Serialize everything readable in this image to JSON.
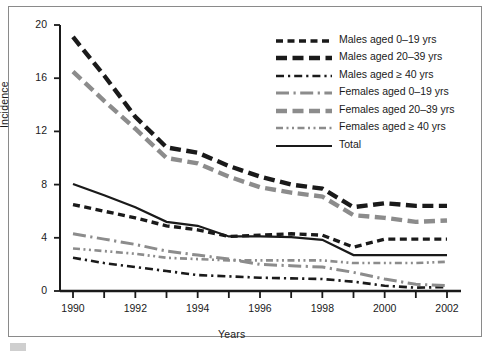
{
  "figure": {
    "y_axis_title": "Incidence",
    "x_axis_title": "Years"
  },
  "chart_data": {
    "type": "line",
    "title": "",
    "xlabel": "Years",
    "ylabel": "Incidence",
    "xlim": [
      1989.5,
      2002.5
    ],
    "ylim": [
      0,
      20
    ],
    "ytick_values": [
      0,
      4,
      8,
      12,
      16,
      20
    ],
    "ytick_labels": [
      "0",
      "4",
      "8",
      "12",
      "16",
      "20"
    ],
    "xtick_values": [
      1990,
      1991,
      1992,
      1993,
      1994,
      1995,
      1996,
      1997,
      1998,
      1999,
      2000,
      2001,
      2002
    ],
    "xtick_labels": [
      "1990",
      "",
      "1992",
      "",
      "1994",
      "",
      "1996",
      "",
      "1998",
      "",
      "2000",
      "",
      "2002"
    ],
    "grid": false,
    "legend_position": "upper right",
    "x": [
      1990,
      1991,
      1992,
      1993,
      1994,
      1995,
      1996,
      1997,
      1998,
      1999,
      2000,
      2001,
      2002
    ],
    "series": [
      {
        "name": "Males aged 0–19 yrs",
        "style": "dashed-short",
        "color": "#1a1a1a",
        "values": [
          6.5,
          6.0,
          5.5,
          4.9,
          4.6,
          4.1,
          4.2,
          4.3,
          4.2,
          3.3,
          3.9,
          3.9,
          3.9
        ]
      },
      {
        "name": "Males aged 20–39 yrs",
        "style": "dashed-long",
        "color": "#1a1a1a",
        "values": [
          19.1,
          16.2,
          13.1,
          10.8,
          10.4,
          9.4,
          8.6,
          8.0,
          7.7,
          6.3,
          6.6,
          6.4,
          6.4
        ]
      },
      {
        "name": "Males aged ≥ 40 yrs",
        "style": "dash-dot",
        "color": "#1a1a1a",
        "values": [
          2.5,
          2.1,
          1.8,
          1.5,
          1.2,
          1.1,
          1.0,
          0.95,
          0.9,
          0.7,
          0.4,
          0.25,
          0.3
        ]
      },
      {
        "name": "Females aged 0–19 yrs",
        "style": "long-dash-dot",
        "color": "#8c8c8c",
        "values": [
          4.3,
          3.9,
          3.5,
          3.0,
          2.7,
          2.4,
          2.0,
          1.9,
          1.8,
          1.4,
          0.9,
          0.5,
          0.4
        ]
      },
      {
        "name": "Females aged 20–39 yrs",
        "style": "dashed-long",
        "color": "#8c8c8c",
        "values": [
          16.5,
          14.3,
          12.2,
          10.0,
          9.6,
          8.6,
          7.8,
          7.4,
          7.1,
          5.7,
          5.5,
          5.2,
          5.3
        ]
      },
      {
        "name": "Females aged ≥ 40 yrs",
        "style": "dash-dot-dot",
        "color": "#8c8c8c",
        "values": [
          3.2,
          3.0,
          2.8,
          2.5,
          2.4,
          2.3,
          2.3,
          2.3,
          2.3,
          2.1,
          2.1,
          2.1,
          2.2
        ]
      },
      {
        "name": "Total",
        "style": "solid",
        "color": "#1a1a1a",
        "values": [
          8.05,
          7.2,
          6.3,
          5.2,
          4.9,
          4.1,
          4.1,
          4.05,
          3.85,
          2.7,
          2.7,
          2.7,
          2.7
        ]
      }
    ]
  }
}
